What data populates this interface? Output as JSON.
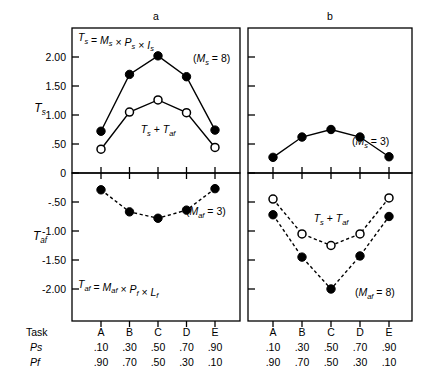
{
  "figure": {
    "panel_letters": [
      "a",
      "b"
    ],
    "axis_names": {
      "top": "T",
      "top_sub": "s",
      "bottom": "T",
      "bottom_sub": "af"
    },
    "formulas": {
      "top_left": {
        "lhs": "T",
        "lhs_sub": "s",
        "rhs": "= M × P × I",
        "text": "Ts = Ms × Ps × Is"
      },
      "bottom_left": {
        "text": "Taf = Maf × Pf × Lf"
      }
    },
    "annotations": {
      "top_left": "(Ms = 8)",
      "top_right": "(Ms = 3)",
      "bottom_left": "(Maf = 3)",
      "bottom_right": "(Maf = 8)",
      "sum_curve_label": "Ts + Taf"
    },
    "row_headers": [
      "Task",
      "Ps",
      "Pf"
    ],
    "task_labels": [
      "A",
      "B",
      "C",
      "D",
      "E"
    ],
    "ps_values": [
      ".10",
      ".30",
      ".50",
      ".70",
      ".90"
    ],
    "pf_values": [
      ".90",
      ".70",
      ".50",
      ".30",
      ".10"
    ],
    "colors": {
      "ink": "#000000",
      "background": "#ffffff"
    }
  },
  "chart_data": [
    {
      "type": "line",
      "panel": "a",
      "position": "top-left",
      "title": "a",
      "xlabel": "Task",
      "ylabel": "Ts",
      "ylim": [
        0,
        2.3
      ],
      "yticks": [
        0,
        0.5,
        1.0,
        1.5,
        2.0
      ],
      "yticklabels": [
        "0",
        ".50",
        "1.00",
        "1.50",
        "2.00"
      ],
      "categories": [
        "A",
        "B",
        "C",
        "D",
        "E"
      ],
      "grid": false,
      "legend": "none",
      "annotation": "(Ms = 8)",
      "formula": "Ts = Ms × Ps × Is",
      "series": [
        {
          "name": "Ts",
          "marker": "filled-circle",
          "linestyle": "solid",
          "values": [
            0.72,
            1.7,
            2.02,
            1.66,
            0.74
          ]
        },
        {
          "name": "Ts + Taf",
          "marker": "open-circle",
          "linestyle": "solid",
          "values": [
            0.41,
            1.05,
            1.26,
            1.04,
            0.44
          ]
        }
      ]
    },
    {
      "type": "line",
      "panel": "b",
      "position": "top-right",
      "title": "b",
      "xlabel": "Task",
      "ylabel": "Ts",
      "ylim": [
        0,
        2.3
      ],
      "yticks": [
        0,
        0.5,
        1.0,
        1.5,
        2.0
      ],
      "yticklabels": [
        "",
        "",
        "",
        "",
        ""
      ],
      "categories": [
        "A",
        "B",
        "C",
        "D",
        "E"
      ],
      "grid": false,
      "legend": "none",
      "annotation": "(Ms = 3)",
      "series": [
        {
          "name": "Ts",
          "marker": "filled-circle",
          "linestyle": "solid",
          "values": [
            0.27,
            0.62,
            0.75,
            0.62,
            0.28
          ]
        }
      ]
    },
    {
      "type": "line",
      "panel": "a",
      "position": "bottom-left",
      "title": "a",
      "xlabel": "Task",
      "ylabel": "Taf",
      "ylim": [
        -2.3,
        0
      ],
      "yticks": [
        -0.5,
        -1.0,
        -1.5,
        -2.0
      ],
      "yticklabels": [
        "-.50",
        "-1.00",
        "-1.50",
        "-2.00"
      ],
      "categories": [
        "A",
        "B",
        "C",
        "D",
        "E"
      ],
      "grid": false,
      "legend": "none",
      "annotation": "(Maf = 3)",
      "formula": "Taf = Maf × Pf × Lf",
      "series": [
        {
          "name": "Taf",
          "marker": "filled-circle",
          "linestyle": "dashed",
          "values": [
            -0.29,
            -0.67,
            -0.78,
            -0.64,
            -0.27
          ]
        }
      ]
    },
    {
      "type": "line",
      "panel": "b",
      "position": "bottom-right",
      "title": "b",
      "xlabel": "Task",
      "ylabel": "Taf",
      "ylim": [
        -2.3,
        0
      ],
      "yticks": [
        -0.5,
        -1.0,
        -1.5,
        -2.0
      ],
      "yticklabels": [
        "",
        "",
        "",
        ""
      ],
      "categories": [
        "A",
        "B",
        "C",
        "D",
        "E"
      ],
      "grid": false,
      "legend": "none",
      "annotation": "(Maf = 8)",
      "series": [
        {
          "name": "Taf",
          "marker": "filled-circle",
          "linestyle": "dashed",
          "values": [
            -0.72,
            -1.45,
            -2.0,
            -1.43,
            -0.75
          ]
        },
        {
          "name": "Ts + Taf",
          "marker": "open-circle",
          "linestyle": "dashed",
          "values": [
            -0.45,
            -1.05,
            -1.25,
            -1.05,
            -0.43
          ]
        }
      ]
    }
  ]
}
